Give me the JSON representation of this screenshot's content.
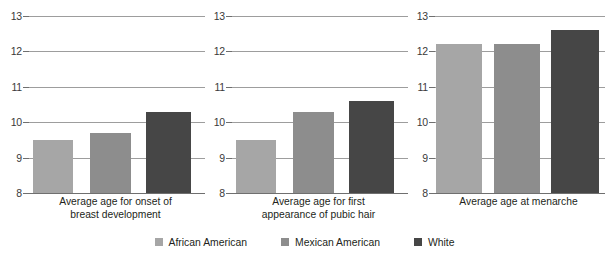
{
  "chart_data": {
    "type": "bar",
    "title": "",
    "xlabel": "",
    "ylabel": "",
    "ylim": [
      8,
      13
    ],
    "yticks": [
      8,
      9,
      10,
      11,
      12,
      13
    ],
    "grid": true,
    "legend_position": "bottom",
    "categories": [
      "Average age for onset of breast development",
      "Average age for first appearance of pubic hair",
      "Average age at menarche"
    ],
    "series": [
      {
        "name": "African American",
        "color": "#a6a6a6",
        "values": [
          9.5,
          9.5,
          12.2
        ]
      },
      {
        "name": "Mexican American",
        "color": "#8d8d8d",
        "values": [
          9.7,
          10.3,
          12.2
        ]
      },
      {
        "name": "White",
        "color": "#464646",
        "values": [
          10.3,
          10.6,
          12.6
        ]
      }
    ]
  },
  "panels": [
    {
      "caption_line1": "Average age for onset of",
      "caption_line2": "breast development"
    },
    {
      "caption_line1": "Average age for first",
      "caption_line2": "appearance of pubic hair"
    },
    {
      "caption_line1": "Average age at menarche",
      "caption_line2": ""
    }
  ],
  "axis": {
    "tick_13": "13",
    "tick_12": "12",
    "tick_11": "11",
    "tick_10": "10",
    "tick_9": "9",
    "tick_8": "8"
  },
  "legend": {
    "items": [
      {
        "label": "African American"
      },
      {
        "label": "Mexican American"
      },
      {
        "label": "White"
      }
    ]
  },
  "colors": {
    "african_american": "#a6a6a6",
    "mexican_american": "#8d8d8d",
    "white": "#464646",
    "gridline": "#9d9d9d",
    "baseline": "#6f6f6f",
    "text": "#231f20"
  }
}
